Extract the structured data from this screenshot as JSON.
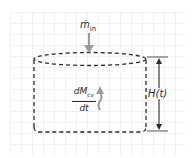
{
  "diagram": {
    "type": "control-volume",
    "shape": "cylinder",
    "outline_style": "dashed",
    "colors": {
      "outline": "#2b2b2b",
      "flow_arrow": "#9a9a9a",
      "dimension_arrow": "#2b2b2b",
      "grid": "#f1f1f1"
    },
    "labels": {
      "mass_flow_in": {
        "symbol": "ṁ",
        "subscript": "in"
      },
      "mass_rate": {
        "numerator": "dM",
        "numerator_subscript": "cv",
        "denominator": "dt"
      },
      "height": "H(t)"
    },
    "arrows": [
      {
        "name": "inflow-arrow",
        "direction": "down",
        "style": "solid-gray"
      },
      {
        "name": "accumulation-arrow",
        "direction": "up",
        "style": "wavy-gray"
      },
      {
        "name": "height-dimension-arrow",
        "direction": "both",
        "style": "solid-black"
      }
    ]
  }
}
